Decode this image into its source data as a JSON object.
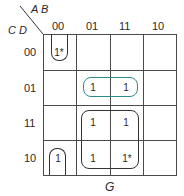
{
  "kmap": {
    "row_var": "C D",
    "col_var": "A B",
    "col_headers": [
      "00",
      "01",
      "11",
      "10"
    ],
    "row_headers": [
      "00",
      "01",
      "11",
      "10"
    ],
    "cells": [
      [
        "1*",
        "",
        "",
        ""
      ],
      [
        "",
        "1",
        "1",
        ""
      ],
      [
        "",
        "1",
        "1",
        ""
      ],
      [
        "1",
        "1",
        "1*",
        ""
      ]
    ],
    "output_label": "G",
    "loop_colors": {
      "default": "#333333",
      "highlight": "#2e8b8b"
    }
  }
}
